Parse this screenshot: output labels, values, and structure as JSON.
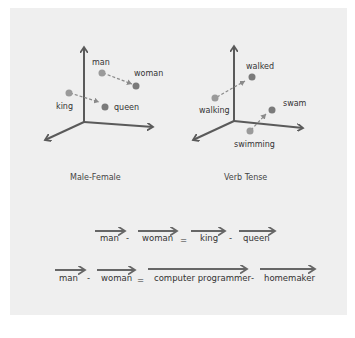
{
  "diagrams": [
    {
      "caption": "Male-Female",
      "points": [
        {
          "label": "man",
          "color": "#9a9a9a"
        },
        {
          "label": "woman",
          "color": "#7a7a7a"
        },
        {
          "label": "king",
          "color": "#9a9a9a"
        },
        {
          "label": "queen",
          "color": "#7a7a7a"
        }
      ],
      "arrows": [
        [
          "man",
          "woman"
        ],
        [
          "king",
          "queen"
        ]
      ]
    },
    {
      "caption": "Verb Tense",
      "points": [
        {
          "label": "walked",
          "color": "#7a7a7a"
        },
        {
          "label": "walking",
          "color": "#9a9a9a"
        },
        {
          "label": "swam",
          "color": "#7a7a7a"
        },
        {
          "label": "swimming",
          "color": "#9a9a9a"
        }
      ],
      "arrows": [
        [
          "walking",
          "walked"
        ],
        [
          "swimming",
          "swam"
        ]
      ]
    }
  ],
  "equations": [
    {
      "terms": [
        "man",
        "-",
        "woman",
        "=",
        "king",
        "-",
        "queen"
      ]
    },
    {
      "terms": [
        "man",
        "-",
        "woman",
        "=",
        "computer programmer",
        "-",
        "homemaker"
      ]
    }
  ],
  "colors": {
    "axis": "#5a5a5a",
    "background": "#efefef",
    "point_light": "#9a9a9a",
    "point_dark": "#7a7a7a"
  }
}
